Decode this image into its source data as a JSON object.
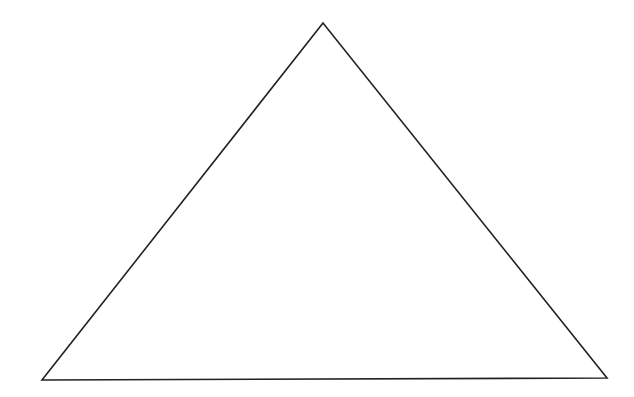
{
  "diagram": {
    "shape": "triangle",
    "vertices": [
      {
        "name": "apex",
        "x": 323,
        "y": 23
      },
      {
        "name": "bottom-left",
        "x": 42,
        "y": 380
      },
      {
        "name": "bottom-right",
        "x": 607,
        "y": 378
      }
    ],
    "stroke_color": "#222222",
    "fill_color": "none",
    "stroke_width": 1.6,
    "background": "#ffffff"
  }
}
